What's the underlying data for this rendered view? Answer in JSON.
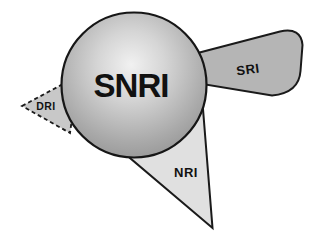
{
  "diagram": {
    "labels": {
      "snri": "SNRI",
      "sri": "SRI",
      "nri": "NRI",
      "dri": "DRI"
    },
    "colors": {
      "background": "#ffffff",
      "outline": "#1a1a1a",
      "label_text": "#111111",
      "sphere_highlight": "#f1f1f1",
      "sphere_light": "#d5d5d5",
      "sphere_mid": "#a9a9a9",
      "sphere_edge": "#878787",
      "sri_fill": "#b5b5b5",
      "nri_fill": "#e0e0e0",
      "dri_fill": "#c8c8c8"
    }
  }
}
